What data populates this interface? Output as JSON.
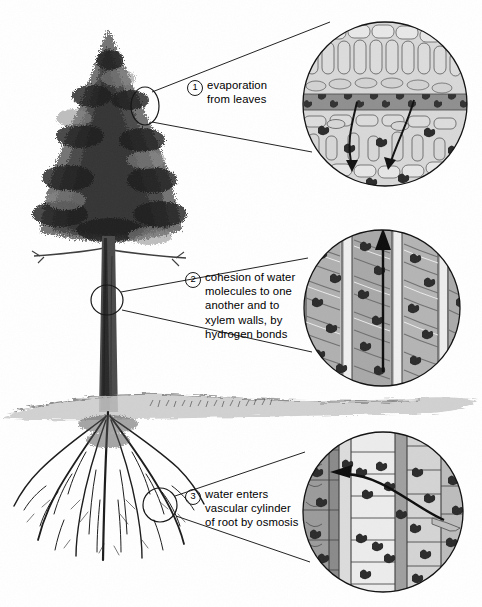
{
  "figure": {
    "background_color": "#ffffff",
    "ink_color": "#1a1a1a"
  },
  "tree": {
    "name": "conifer-tree",
    "canopy_label": "needle canopy",
    "trunk_label": "trunk",
    "roots_label": "root system",
    "ground_label": "soil surface"
  },
  "callouts": [
    {
      "number": "1",
      "text": "evaporation\nfrom leaves",
      "marker_name": "tree-marker-leaves",
      "inset_name": "leaf-cross-section-inset",
      "inset_caption": "leaf mesophyll cells with water molecules and downward arrows"
    },
    {
      "number": "2",
      "text": "cohesion of water\nmolecules to one\nanother and to\nxylem walls, by\nhydrogen bonds",
      "marker_name": "tree-marker-trunk",
      "inset_name": "xylem-vessel-inset",
      "inset_caption": "xylem vessel elements with upward arrow"
    },
    {
      "number": "3",
      "text": "water enters\nvascular cylinder\nof root by osmosis",
      "marker_name": "tree-marker-root",
      "inset_name": "root-cells-inset",
      "inset_caption": "root cortex cells with leftward arrow into vascular cylinder"
    }
  ],
  "colors": {
    "cell_fill": "#cfcfcf",
    "cell_light": "#e3e3e3",
    "cell_dark": "#9a9a9a",
    "water_molecule": "#2a2a2a",
    "soil": "#b9b9b9"
  }
}
